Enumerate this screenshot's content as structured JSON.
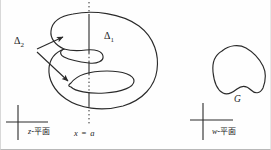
{
  "figure": {
    "stroke_color": "#2a2a2a",
    "background_color": "#fefefe"
  },
  "labels": {
    "delta_2": "Δ",
    "delta_2_sub": "2",
    "delta_1": "Δ",
    "delta_1_sub": "1",
    "z_plane": "-平面",
    "z_plane_var": "z",
    "w_plane": "-平面",
    "w_plane_var": "w",
    "line_equation": "x = a",
    "region_g": "G"
  },
  "elements": {
    "z_axes": "axis-cross-left",
    "w_axes": "axis-cross-right",
    "dividing_line": "vertical-dotted-line",
    "region_boundary": "closed-curve-with-two-lobes",
    "image_boundary": "closed-curve-g",
    "arrow_upper": "arrow-to-upper-lobe",
    "arrow_lower": "arrow-to-lower-lobe"
  }
}
